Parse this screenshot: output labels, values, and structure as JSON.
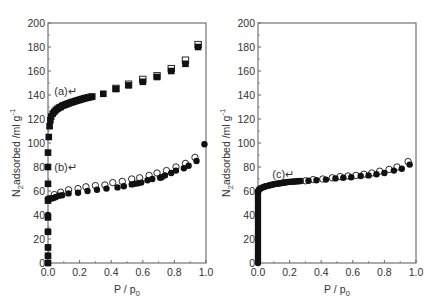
{
  "chart_data": [
    {
      "type": "scatter",
      "panel": "left",
      "xlabel": "P / p0",
      "ylabel": "N2 adsorbed / ml g-1",
      "xlim": [
        0.0,
        1.0
      ],
      "ylim": [
        0,
        200
      ],
      "xticks": [
        "0.0",
        "0.2",
        "0.4",
        "0.6",
        "0.8",
        "1.0"
      ],
      "yticks": [
        "0",
        "20",
        "40",
        "60",
        "80",
        "100",
        "120",
        "140",
        "160",
        "180",
        "200"
      ],
      "grid": false,
      "annotations": [
        {
          "text": "(a)↵",
          "x": 0.04,
          "y": 143
        },
        {
          "text": "(b)↵",
          "x": 0.04,
          "y": 80
        }
      ],
      "series": [
        {
          "name": "(a) adsorption",
          "marker": "filled-square",
          "x": [
            0.0,
            0.0,
            0.0,
            0.0,
            0.0,
            0.0,
            0.0,
            0.0,
            0.0,
            0.005,
            0.01,
            0.015,
            0.02,
            0.03,
            0.04,
            0.05,
            0.06,
            0.07,
            0.08,
            0.09,
            0.1,
            0.11,
            0.12,
            0.13,
            0.14,
            0.15,
            0.16,
            0.17,
            0.18,
            0.19,
            0.2,
            0.21,
            0.22,
            0.23,
            0.24,
            0.25,
            0.26,
            0.27,
            0.28,
            0.35,
            0.43,
            0.51,
            0.6,
            0.69,
            0.78,
            0.87,
            0.95
          ],
          "y": [
            0,
            6,
            13,
            26,
            38,
            52,
            66,
            80,
            92,
            105,
            114,
            119,
            122,
            124.5,
            126,
            127.5,
            128.5,
            129.5,
            130,
            131,
            131.5,
            132,
            132.5,
            133,
            133.5,
            134,
            134.3,
            134.8,
            135.2,
            135.6,
            136,
            136.4,
            136.8,
            137.2,
            137.5,
            137.8,
            138.1,
            138.4,
            138.7,
            141,
            145,
            148,
            151,
            155,
            160,
            166,
            180
          ]
        },
        {
          "name": "(a) desorption",
          "marker": "open-square",
          "x": [
            0.43,
            0.51,
            0.6,
            0.69,
            0.78,
            0.87,
            0.95
          ],
          "y": [
            145.5,
            149,
            153,
            156,
            162,
            169,
            182
          ]
        },
        {
          "name": "(b) adsorption",
          "marker": "filled-circle",
          "x": [
            0.0,
            0.0,
            0.0,
            0.0,
            0.0,
            0.0,
            0.01,
            0.02,
            0.03,
            0.04,
            0.05,
            0.07,
            0.09,
            0.13,
            0.19,
            0.25,
            0.31,
            0.37,
            0.44,
            0.48,
            0.53,
            0.55,
            0.57,
            0.59,
            0.63,
            0.66,
            0.71,
            0.72,
            0.74,
            0.78,
            0.81,
            0.86,
            0.89,
            0.94,
            0.99
          ],
          "y": [
            0,
            6,
            13,
            26,
            40,
            53.5,
            53.5,
            54,
            54,
            54.5,
            55,
            56,
            56.5,
            58,
            58.5,
            60,
            61,
            62,
            63,
            64,
            65.5,
            66,
            66.5,
            67,
            69,
            70,
            71,
            71.5,
            73,
            75,
            77,
            79,
            81,
            85,
            99
          ]
        },
        {
          "name": "(b) desorption",
          "marker": "open-circle",
          "x": [
            0.04,
            0.08,
            0.13,
            0.19,
            0.24,
            0.3,
            0.36,
            0.41,
            0.47,
            0.53,
            0.58,
            0.64,
            0.69,
            0.75,
            0.81,
            0.87,
            0.93
          ],
          "y": [
            57,
            59,
            61,
            62,
            63.5,
            64.5,
            65,
            67,
            68,
            70,
            71,
            73,
            75,
            77,
            80,
            83,
            88
          ]
        }
      ]
    },
    {
      "type": "scatter",
      "panel": "right",
      "xlabel": "P / p0",
      "ylabel": "N2 adsorbed / ml g-1",
      "xlim": [
        0.0,
        1.0
      ],
      "ylim": [
        0,
        200
      ],
      "xticks": [
        "0.0",
        "0.2",
        "0.4",
        "0.6",
        "0.8",
        "1.0"
      ],
      "yticks": [
        "0",
        "20",
        "40",
        "60",
        "80",
        "100",
        "120",
        "140",
        "160",
        "180",
        "200"
      ],
      "grid": false,
      "annotations": [
        {
          "text": "(c)↵",
          "x": 0.09,
          "y": 74
        }
      ],
      "series": [
        {
          "name": "(c) adsorption",
          "marker": "filled-circle",
          "x": [
            0.0,
            0.0,
            0.0,
            0.0,
            0.0,
            0.0,
            0.0,
            0.0,
            0.0,
            0.0,
            0.0,
            0.0,
            0.0,
            0.0,
            0.0,
            0.0,
            0.0,
            0.0,
            0.0,
            0.0,
            0.0,
            0.0,
            0.0,
            0.0,
            0.0,
            0.0,
            0.0,
            0.0,
            0.0,
            0.0,
            0.0,
            0.003,
            0.006,
            0.01,
            0.015,
            0.02,
            0.03,
            0.04,
            0.05,
            0.06,
            0.07,
            0.08,
            0.09,
            0.1,
            0.11,
            0.12,
            0.13,
            0.14,
            0.15,
            0.16,
            0.17,
            0.18,
            0.19,
            0.2,
            0.21,
            0.22,
            0.23,
            0.24,
            0.25,
            0.26,
            0.27,
            0.32,
            0.37,
            0.43,
            0.49,
            0.54,
            0.59,
            0.65,
            0.7,
            0.75,
            0.8,
            0.86,
            0.91,
            0.96
          ],
          "y": [
            0,
            2,
            4,
            6,
            8,
            10,
            12,
            14,
            16,
            18,
            20,
            22,
            24,
            26,
            28,
            30,
            32,
            34,
            36,
            38,
            40,
            42,
            44,
            46,
            48,
            50,
            52,
            54,
            56,
            58,
            59.5,
            60.5,
            61,
            61.5,
            62,
            62.5,
            63,
            63.5,
            64,
            64.3,
            64.6,
            65,
            65.3,
            65.6,
            65.9,
            66.1,
            66.3,
            66.5,
            66.7,
            66.9,
            67.1,
            67.3,
            67.5,
            67.6,
            67.7,
            67.8,
            67.9,
            68,
            68.1,
            68.2,
            68.3,
            68.5,
            69,
            69.5,
            70.5,
            71,
            71.5,
            72.5,
            73,
            74,
            75,
            77,
            78.5,
            82
          ]
        },
        {
          "name": "(c) desorption",
          "marker": "open-circle",
          "x": [
            0.3,
            0.35,
            0.41,
            0.47,
            0.52,
            0.57,
            0.62,
            0.67,
            0.72,
            0.77,
            0.83,
            0.88,
            0.95
          ],
          "y": [
            68.5,
            69.5,
            70,
            71,
            72,
            72.5,
            73,
            74,
            75,
            76.5,
            78,
            80,
            84.5
          ]
        }
      ]
    }
  ],
  "panels": [
    {
      "ylabel_main": "N",
      "ylabel_sub": "2",
      "ylabel_rest": "adsorbed /ml g",
      "ylabel_sup": "-1",
      "xlabel_main": "P / p",
      "xlabel_sub": "0"
    },
    {
      "ylabel_main": "N",
      "ylabel_sub": "2",
      "ylabel_rest": "adsorbed /ml g",
      "ylabel_sup": "-1",
      "xlabel_main": "P / p",
      "xlabel_sub": "0"
    }
  ],
  "colors": {
    "axis": "#666666",
    "marker": "#111111",
    "text": "#333333",
    "background": "#ffffff"
  }
}
